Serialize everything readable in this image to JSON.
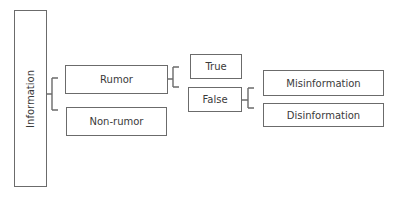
{
  "diagram": {
    "type": "taxonomy-tree",
    "nodes": {
      "root": "Information",
      "rumor": "Rumor",
      "non_rumor": "Non-rumor",
      "true": "True",
      "false": "False",
      "misinformation": "Misinformation",
      "disinformation": "Disinformation"
    },
    "edges": [
      [
        "Information",
        "Rumor"
      ],
      [
        "Information",
        "Non-rumor"
      ],
      [
        "Rumor",
        "True"
      ],
      [
        "Rumor",
        "False"
      ],
      [
        "False",
        "Misinformation"
      ],
      [
        "False",
        "Disinformation"
      ]
    ],
    "colors": {
      "stroke": "#6b6b6b",
      "text": "#3a3a3a",
      "background": "#ffffff"
    }
  }
}
